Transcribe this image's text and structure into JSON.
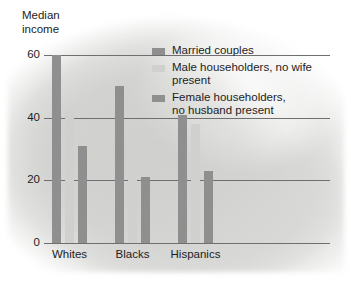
{
  "chart_data": {
    "type": "bar",
    "title": "",
    "subtitle": "",
    "ylabel": "Median\nincome",
    "xlabel": "",
    "categories": [
      "Whites",
      "Blacks",
      "Hispanics"
    ],
    "series": [
      {
        "name": "Married couples",
        "values": [
          60,
          50,
          41
        ],
        "color": "#8f8f8f"
      },
      {
        "name": "Male householders, no wife present",
        "values": [
          42,
          35,
          38
        ],
        "color": "#d0d0ce"
      },
      {
        "name": "Female householders,\nno husband present",
        "values": [
          31,
          21,
          23
        ],
        "color": "#8f8f8f"
      }
    ],
    "ylim": [
      0,
      60
    ],
    "yticks": [
      0,
      20,
      40,
      60
    ],
    "ytick_labels": [
      "0",
      "20",
      "40",
      "60"
    ],
    "grid": true,
    "legend_position": "upper-right-inside"
  },
  "legend": {
    "entries": [
      {
        "label": "Married couples",
        "swatch": "dark-gray-swatch"
      },
      {
        "label": "Male householders, no wife present",
        "swatch": "light-gray-swatch"
      },
      {
        "label": "Female householders,\nno husband present",
        "swatch": "dark-gray-swatch"
      }
    ]
  },
  "colors": {
    "dark_bar": "#8f8f8f",
    "light_bar": "#d0d0ce",
    "gridline": "#6f6f6f",
    "text": "#1d1d1d",
    "background": "#ffffff",
    "blob": "#d6d6d4"
  }
}
